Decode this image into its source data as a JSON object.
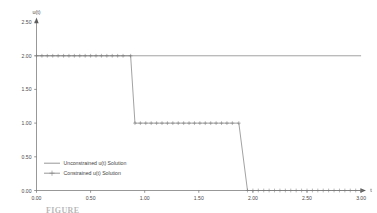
{
  "chart_data": {
    "type": "line",
    "title": "",
    "xlabel": "t",
    "ylabel": "u(t)",
    "xlim": [
      0.0,
      3.0
    ],
    "ylim": [
      0.0,
      2.5
    ],
    "xticks": [
      "0.00",
      "0.50",
      "1.00",
      "1.50",
      "2.00",
      "2.50",
      "3.00"
    ],
    "xtick_values": [
      0.0,
      0.5,
      1.0,
      1.5,
      2.0,
      2.5,
      3.0
    ],
    "yticks": [
      "0.00",
      "0.50",
      "1.00",
      "1.50",
      "2.00",
      "2.50"
    ],
    "ytick_values": [
      0.0,
      0.5,
      1.0,
      1.5,
      2.0,
      2.5
    ],
    "grid": false,
    "legend_position": "lower-left",
    "series": [
      {
        "name": "Unconstrained u(t) Solution",
        "style": "line",
        "marker": "none",
        "color": "#7a7a7a",
        "x": [
          0.0,
          3.0
        ],
        "y": [
          2.0,
          2.0
        ]
      },
      {
        "name": "Constrained u(t) Solution",
        "style": "line-marker",
        "marker": "plus",
        "color": "#7a7a7a",
        "x": [
          0.0,
          0.05,
          0.1,
          0.15,
          0.2,
          0.25,
          0.3,
          0.35,
          0.4,
          0.45,
          0.5,
          0.55,
          0.6,
          0.65,
          0.7,
          0.75,
          0.8,
          0.87,
          0.91,
          0.96,
          1.01,
          1.06,
          1.11,
          1.16,
          1.21,
          1.26,
          1.31,
          1.36,
          1.41,
          1.46,
          1.51,
          1.56,
          1.61,
          1.66,
          1.71,
          1.76,
          1.81,
          1.87,
          1.95,
          2.0,
          2.05,
          2.1,
          2.15,
          2.2,
          2.25,
          2.3,
          2.35,
          2.4,
          2.45,
          2.5,
          2.55,
          2.6,
          2.65,
          2.7,
          2.75,
          2.8,
          2.85,
          2.9,
          2.95,
          3.0
        ],
        "y": [
          2.0,
          2.0,
          2.0,
          2.0,
          2.0,
          2.0,
          2.0,
          2.0,
          2.0,
          2.0,
          2.0,
          2.0,
          2.0,
          2.0,
          2.0,
          2.0,
          2.0,
          2.0,
          1.0,
          1.0,
          1.0,
          1.0,
          1.0,
          1.0,
          1.0,
          1.0,
          1.0,
          1.0,
          1.0,
          1.0,
          1.0,
          1.0,
          1.0,
          1.0,
          1.0,
          1.0,
          1.0,
          1.0,
          0.0,
          0.0,
          0.0,
          0.0,
          0.0,
          0.0,
          0.0,
          0.0,
          0.0,
          0.0,
          0.0,
          0.0,
          0.0,
          0.0,
          0.0,
          0.0,
          0.0,
          0.0,
          0.0,
          0.0,
          0.0,
          0.0
        ]
      }
    ],
    "annotations": []
  },
  "axes": {
    "y_axis_title": "u(t)",
    "x_axis_title": "t"
  },
  "legend": {
    "entries": [
      {
        "label": "Unconstrained u(t) Solution"
      },
      {
        "label": "Constrained u(t) Solution"
      }
    ]
  },
  "caption": {
    "partial_text": "FIGURE"
  }
}
